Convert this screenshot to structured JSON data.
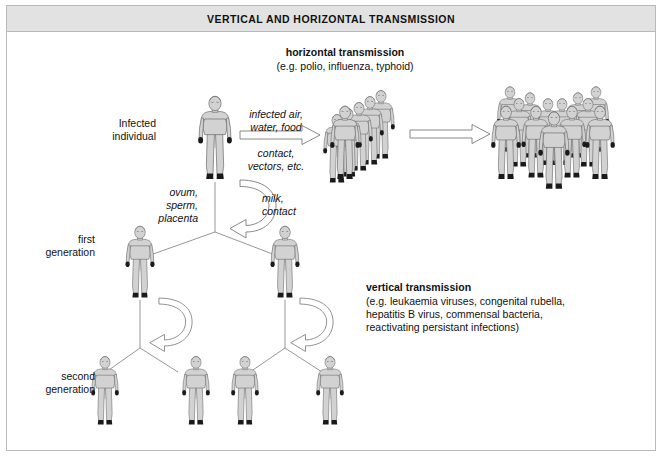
{
  "title": "VERTICAL AND HORIZONTAL TRANSMISSION",
  "labels": {
    "horizontal_heading": "horizontal transmission",
    "horizontal_examples": "(e.g. polio, influenza, typhoid)",
    "infected_individual_line1": "Infected",
    "infected_individual_line2": "individual",
    "route_air_line1": "infected air,",
    "route_air_line2": "water, food",
    "route_contact_line1": "contact,",
    "route_contact_line2": "vectors, etc.",
    "ovum_line1": "ovum,",
    "ovum_line2": "sperm,",
    "ovum_line3": "placenta",
    "milk_line1": "milk,",
    "milk_line2": "contact",
    "first_generation_line1": "first",
    "first_generation_line2": "generation",
    "second_generation_line1": "second",
    "second_generation_line2": "generation",
    "vertical_heading": "vertical transmission",
    "vertical_examples_line1": "(e.g. leukaemia viruses, congenital rubella,",
    "vertical_examples_line2": "hepatitis B virus, commensal bacteria,",
    "vertical_examples_line3": "reactivating persistant infections)"
  },
  "colors": {
    "frame_border": "#b9b9b9",
    "title_background": "#e2e2e2",
    "figure_fill": "#d2d2d2",
    "figure_outline": "#6d6d6d",
    "extremity": "#1a1a1a",
    "arrow_outline": "#7a7a7a",
    "line": "#8a8a8a",
    "text": "#111111",
    "page_background": "#ffffff"
  },
  "diagram": {
    "type": "transmission-flow-diagram",
    "source_figure": {
      "x": 215,
      "y": 100,
      "scale": 1.0
    },
    "horizontal_arrows": [
      {
        "name": "arrow-air-water-food",
        "from_x": 238,
        "to_x": 322,
        "y": 134
      },
      {
        "name": "arrow-crowd-to-crowd",
        "from_x": 408,
        "to_x": 486,
        "y": 133
      }
    ],
    "crowd_small": {
      "count": 6,
      "x": 325,
      "y": 95,
      "label": "first-wave-crowd"
    },
    "crowd_large": {
      "count": 13,
      "x": 490,
      "y": 88,
      "label": "second-wave-crowd"
    },
    "generations": {
      "first": {
        "count": 2,
        "y": 226,
        "xs": [
          127,
          272
        ]
      },
      "second": {
        "count": 4,
        "y": 358,
        "xs": [
          93,
          166,
          240,
          310
        ]
      }
    },
    "curved_arrows": [
      {
        "name": "vertical-arrow-to-first-generation",
        "cx": 248,
        "cy": 205
      },
      {
        "name": "vertical-arrow-to-second-generation-left",
        "cx": 152,
        "cy": 320
      },
      {
        "name": "vertical-arrow-to-second-generation-right",
        "cx": 293,
        "cy": 320
      }
    ]
  }
}
